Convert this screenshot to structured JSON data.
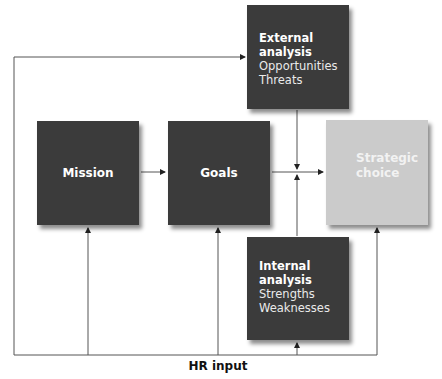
{
  "diagram": {
    "nodes": {
      "external": {
        "title_line1": "External",
        "title_line2": "analysis",
        "items": [
          "Opportunities",
          "Threats"
        ]
      },
      "mission": {
        "label": "Mission"
      },
      "goals": {
        "label": "Goals"
      },
      "strategic": {
        "line1": "Strategic",
        "line2": "choice"
      },
      "internal": {
        "title_line1": "Internal",
        "title_line2": "analysis",
        "items": [
          "Strengths",
          "Weaknesses"
        ]
      }
    },
    "hr_input": "HR input",
    "colors": {
      "dark_box": "#3b3b3b",
      "light_box": "#cbcbcb",
      "line": "#333333"
    }
  }
}
